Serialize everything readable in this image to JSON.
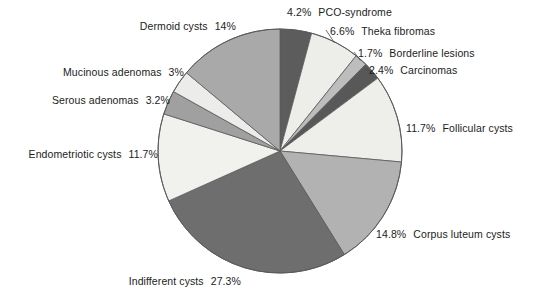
{
  "chart_data": {
    "type": "pie",
    "title": "",
    "subtitle": "",
    "xlabel": "",
    "ylabel": "",
    "legend_position": "labels-with-leader-lines",
    "grid": false,
    "start_angle_deg": 0,
    "direction": "clockwise",
    "units": "percent",
    "categories": [
      "PCO-syndrome",
      "Theka fibromas",
      "Borderline lesions",
      "Carcinomas",
      "Follicular cysts",
      "Corpus luteum cysts",
      "Indifferent cysts",
      "Endometriotic cysts",
      "Serous adenomas",
      "Mucinous adenomas",
      "Dermoid cysts"
    ],
    "values": [
      4.2,
      6.6,
      1.7,
      2.4,
      11.7,
      14.8,
      27.3,
      11.7,
      3.2,
      3,
      14
    ],
    "value_labels": [
      "4.2%",
      "6.6%",
      "1.7%",
      "2.4%",
      "11.7%",
      "14.8%",
      "27.3%",
      "11.7%",
      "3.2%",
      "3%",
      "14%"
    ],
    "colors": [
      "#5c5c5c",
      "#ededea",
      "#bdbdbd",
      "#585858",
      "#eeeeea",
      "#b2b2b2",
      "#6e6e6e",
      "#f1f1ee",
      "#a0a0a0",
      "#ececea",
      "#a9a9a9"
    ],
    "slices": [
      {
        "label": "PCO-syndrome",
        "value": 4.2,
        "value_label": "4.2%",
        "color": "#5c5c5c",
        "label_side": "right"
      },
      {
        "label": "Theka fibromas",
        "value": 6.6,
        "value_label": "6.6%",
        "color": "#ededea",
        "label_side": "right"
      },
      {
        "label": "Borderline lesions",
        "value": 1.7,
        "value_label": "1.7%",
        "color": "#bdbdbd",
        "label_side": "right"
      },
      {
        "label": "Carcinomas",
        "value": 2.4,
        "value_label": "2.4%",
        "color": "#585858",
        "label_side": "right"
      },
      {
        "label": "Follicular cysts",
        "value": 11.7,
        "value_label": "11.7%",
        "color": "#eeeeea",
        "label_side": "right"
      },
      {
        "label": "Corpus luteum cysts",
        "value": 14.8,
        "value_label": "14.8%",
        "color": "#b2b2b2",
        "label_side": "right"
      },
      {
        "label": "Indifferent cysts",
        "value": 27.3,
        "value_label": "27.3%",
        "color": "#6e6e6e",
        "label_side": "left"
      },
      {
        "label": "Endometriotic cysts",
        "value": 11.7,
        "value_label": "11.7%",
        "color": "#f1f1ee",
        "label_side": "left"
      },
      {
        "label": "Serous adenomas",
        "value": 3.2,
        "value_label": "3.2%",
        "color": "#a0a0a0",
        "label_side": "left"
      },
      {
        "label": "Mucinous adenomas",
        "value": 3,
        "value_label": "3%",
        "color": "#ececea",
        "label_side": "left"
      },
      {
        "label": "Dermoid cysts",
        "value": 14,
        "value_label": "14%",
        "color": "#a9a9a9",
        "label_side": "left"
      }
    ],
    "geometry": {
      "center_x": 280,
      "center_y": 151,
      "radius": 122
    },
    "outline_color": "#5a5a5a"
  }
}
